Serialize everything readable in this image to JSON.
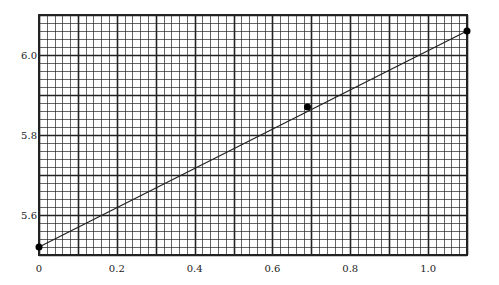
{
  "chart_data": {
    "type": "line",
    "title": "",
    "xlabel": "",
    "ylabel": "",
    "xlim": [
      0,
      1.1
    ],
    "ylim": [
      5.5,
      6.1
    ],
    "grid": {
      "on": true,
      "minor_x_step": 0.02,
      "minor_y_step": 0.02,
      "major_x_step": 0.1,
      "major_y_step": 0.1
    },
    "x_ticks": [
      0,
      0.2,
      0.4,
      0.6,
      0.8,
      1.0
    ],
    "x_tick_labels": [
      "0",
      "0.2",
      "0.4",
      "0.6",
      "0.8",
      "1.0"
    ],
    "y_ticks": [
      5.6,
      5.8,
      6.0
    ],
    "y_tick_labels": [
      "5.6",
      "5.8",
      "6.0"
    ],
    "series": [
      {
        "name": "data points",
        "kind": "scatter",
        "x": [
          0,
          0.69,
          1.1
        ],
        "y": [
          5.52,
          5.87,
          6.06
        ]
      },
      {
        "name": "fit line",
        "kind": "line",
        "x": [
          0,
          1.1
        ],
        "y": [
          5.52,
          6.06
        ]
      }
    ],
    "legend": null
  },
  "colors": {
    "grid": "#222222",
    "line": "#222222",
    "point": "#000000",
    "background": "#ffffff"
  }
}
